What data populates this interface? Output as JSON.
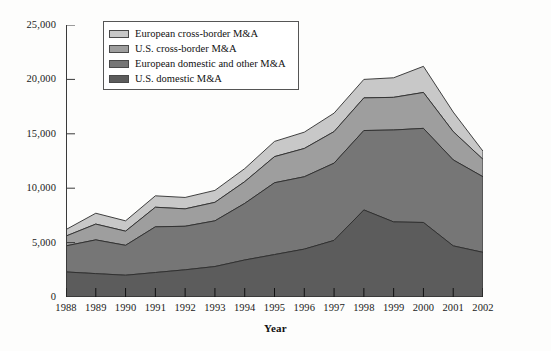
{
  "chart_data": {
    "type": "area",
    "stacked": true,
    "title": "",
    "subtitle": "",
    "xlabel": "Year",
    "ylabel": "",
    "grid": false,
    "legend_position": "top-left",
    "categories": [
      1988,
      1989,
      1990,
      1991,
      1992,
      1993,
      1994,
      1995,
      1996,
      1997,
      1998,
      1999,
      2000,
      2001,
      2002
    ],
    "x": [
      "1988",
      "1989",
      "1990",
      "1991",
      "1992",
      "1993",
      "1994",
      "1995",
      "1996",
      "1997",
      "1998",
      "1999",
      "2000",
      "2001",
      "2002"
    ],
    "xlim": [
      1988,
      2002
    ],
    "ylim": [
      0,
      25000
    ],
    "yticks": [
      0,
      5000,
      10000,
      15000,
      20000,
      25000
    ],
    "ytick_labels": [
      "0",
      "5,000",
      "10,000",
      "15,000",
      "20,000",
      "25,000"
    ],
    "series": [
      {
        "name": "U.S. domestic M&A",
        "color": "#5c5c5c",
        "values": [
          2300,
          2150,
          2000,
          2250,
          2500,
          2800,
          3400,
          3900,
          4400,
          5200,
          8000,
          6900,
          6850,
          4700,
          4100
        ]
      },
      {
        "name": "European domestic and other M&A",
        "color": "#767676",
        "values": [
          2400,
          3100,
          2750,
          4200,
          4000,
          4200,
          5200,
          6600,
          6650,
          7100,
          7300,
          8450,
          8650,
          7900,
          6950
        ]
      },
      {
        "name": "U.S. cross-border M&A",
        "color": "#9e9e9e",
        "values": [
          900,
          1450,
          1300,
          1800,
          1600,
          1700,
          2000,
          2400,
          2600,
          2900,
          3000,
          3000,
          3300,
          2600,
          1600
        ]
      },
      {
        "name": "European cross-border M&A",
        "color": "#c8c8c8",
        "values": [
          600,
          1000,
          950,
          1050,
          1050,
          1100,
          1200,
          1400,
          1500,
          1700,
          1700,
          1800,
          2400,
          1800,
          750
        ]
      }
    ],
    "totals": [
      6200,
      7700,
      7000,
      9300,
      9150,
      9800,
      11800,
      14300,
      15150,
      16900,
      20000,
      20150,
      21200,
      17000,
      13400
    ]
  },
  "axis": {
    "y_labels": [
      "25,000",
      "20,000",
      "15,000",
      "10,000",
      "5,000",
      "0"
    ],
    "x_labels": [
      "1988",
      "1989",
      "1990",
      "1991",
      "1992",
      "1993",
      "1994",
      "1995",
      "1996",
      "1997",
      "1998",
      "1999",
      "2000",
      "2001",
      "2002"
    ],
    "x_title": "Year"
  },
  "legend": {
    "items": [
      {
        "label": "European cross-border M&A",
        "color": "#c8c8c8"
      },
      {
        "label": "U.S. cross-border M&A",
        "color": "#9e9e9e"
      },
      {
        "label": "European domestic and other M&A",
        "color": "#767676"
      },
      {
        "label": "U.S. domestic M&A",
        "color": "#5c5c5c"
      }
    ]
  }
}
